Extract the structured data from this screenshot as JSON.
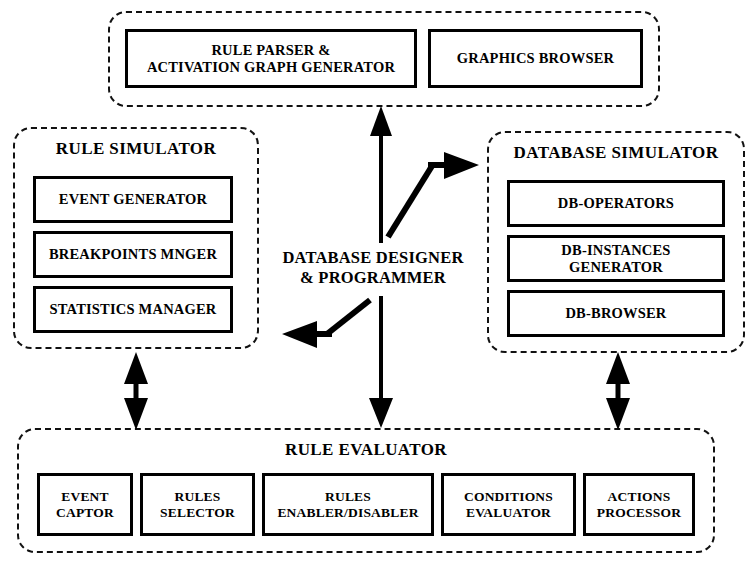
{
  "diagram": {
    "panels": {
      "parser": {
        "boxes": [
          {
            "label": "RULE PARSER &\nACTIVATION GRAPH  GENERATOR"
          },
          {
            "label": "GRAPHICS BROWSER"
          }
        ]
      },
      "rule_simulator": {
        "title": "RULE SIMULATOR",
        "boxes": [
          {
            "label": "EVENT GENERATOR"
          },
          {
            "label": "BREAKPOINTS MNGER"
          },
          {
            "label": "STATISTICS MANAGER"
          }
        ]
      },
      "database_simulator": {
        "title": "DATABASE SIMULATOR",
        "boxes": [
          {
            "label": "DB-OPERATORS"
          },
          {
            "label": "DB-INSTANCES GENERATOR"
          },
          {
            "label": "DB-BROWSER"
          }
        ]
      },
      "rule_evaluator": {
        "title": "RULE EVALUATOR",
        "boxes": [
          {
            "label": "EVENT\nCAPTOR"
          },
          {
            "label": "RULES\nSELECTOR"
          },
          {
            "label": "RULES\nENABLER/DISABLER"
          },
          {
            "label": "CONDITIONS\nEVALUATOR"
          },
          {
            "label": "ACTIONS\nPROCESSOR"
          }
        ]
      }
    },
    "center_actor": {
      "line1": "DATABASE DESIGNER",
      "line2": "& PROGRAMMER"
    },
    "arrows": [
      {
        "name": "actor-to-parser",
        "direction": "up",
        "style": "single"
      },
      {
        "name": "actor-to-database-simulator",
        "direction": "up-right",
        "style": "single-bent"
      },
      {
        "name": "actor-to-rule-simulator",
        "direction": "down-left",
        "style": "single-bent"
      },
      {
        "name": "actor-to-rule-evaluator",
        "direction": "down",
        "style": "single"
      },
      {
        "name": "rule-simulator-to-rule-evaluator",
        "direction": "vertical",
        "style": "double"
      },
      {
        "name": "database-simulator-to-rule-evaluator",
        "direction": "vertical",
        "style": "double"
      }
    ],
    "colors": {
      "ink": "#000000",
      "background": "#ffffff"
    }
  }
}
